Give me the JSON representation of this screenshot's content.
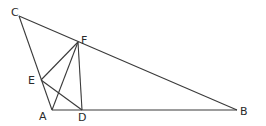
{
  "diagram": {
    "type": "geometry",
    "points": {
      "A": {
        "label": "A",
        "x": 52,
        "y": 110,
        "lx": 39,
        "ly": 120
      },
      "B": {
        "label": "B",
        "x": 237,
        "y": 110,
        "lx": 240,
        "ly": 115
      },
      "C": {
        "label": "C",
        "x": 19,
        "y": 16,
        "lx": 11,
        "ly": 16
      },
      "D": {
        "label": "D",
        "x": 82,
        "y": 110,
        "lx": 78,
        "ly": 121
      },
      "E": {
        "label": "E",
        "x": 41,
        "y": 80,
        "lx": 28,
        "ly": 84
      },
      "F": {
        "label": "F",
        "x": 78,
        "y": 42,
        "lx": 81,
        "ly": 44
      }
    },
    "segments": [
      [
        "C",
        "A"
      ],
      [
        "C",
        "B"
      ],
      [
        "A",
        "B"
      ],
      [
        "E",
        "F"
      ],
      [
        "A",
        "F"
      ],
      [
        "F",
        "D"
      ],
      [
        "E",
        "D"
      ]
    ],
    "stroke_color": "#3a3a3a"
  }
}
